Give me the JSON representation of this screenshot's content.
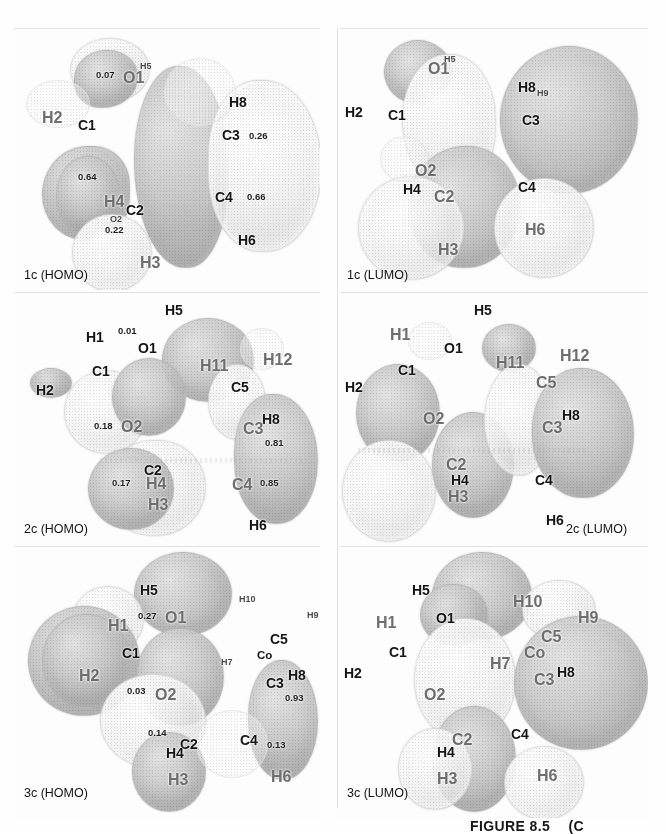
{
  "figure": {
    "caption": "FIGURE 8.5",
    "caption_suffix": "(C",
    "width": 666,
    "height": 832,
    "colors": {
      "background": "#fefefe",
      "lobe_light": "#f1f1f1",
      "lobe_dark": "#c9c9c9",
      "atom": "#a0a0a0",
      "text": "#151515",
      "rule": "#e2e2e2"
    }
  },
  "panels": [
    {
      "id": "1c-homo",
      "tag": "1c (HOMO)",
      "row": 0,
      "col": 0,
      "atoms": [
        {
          "label": "C1",
          "size": "big",
          "x": 78,
          "y": 118
        },
        {
          "label": "H2",
          "size": "faint",
          "x": 42,
          "y": 110
        },
        {
          "label": "O1",
          "size": "faint",
          "x": 123,
          "y": 70
        },
        {
          "label": "H5",
          "size": "sm",
          "x": 140,
          "y": 62
        },
        {
          "label": "C2",
          "size": "big",
          "x": 126,
          "y": 203
        },
        {
          "label": "H4",
          "size": "faint",
          "x": 104,
          "y": 194
        },
        {
          "label": "H3",
          "size": "faint",
          "x": 140,
          "y": 255
        },
        {
          "label": "O2",
          "size": "sm",
          "x": 110,
          "y": 215
        },
        {
          "label": "C3",
          "size": "big",
          "x": 222,
          "y": 128
        },
        {
          "label": "H8",
          "size": "big",
          "x": 229,
          "y": 95
        },
        {
          "label": "C4",
          "size": "big",
          "x": 215,
          "y": 190
        },
        {
          "label": "H6",
          "size": "big",
          "x": 238,
          "y": 233
        }
      ],
      "values": [
        {
          "text": "0.07",
          "x": 96,
          "y": 70
        },
        {
          "text": "0.64",
          "x": 78,
          "y": 172
        },
        {
          "text": "0.22",
          "x": 105,
          "y": 225
        },
        {
          "text": "0.26",
          "x": 249,
          "y": 131
        },
        {
          "text": "0.66",
          "x": 247,
          "y": 192
        }
      ]
    },
    {
      "id": "1c-lumo",
      "tag": "1c (LUMO)",
      "row": 0,
      "col": 1,
      "atoms": [
        {
          "label": "C1",
          "size": "big",
          "x": 388,
          "y": 108
        },
        {
          "label": "H2",
          "size": "big",
          "x": 345,
          "y": 105
        },
        {
          "label": "O1",
          "size": "faint",
          "x": 428,
          "y": 61
        },
        {
          "label": "H5",
          "size": "sm",
          "x": 444,
          "y": 55
        },
        {
          "label": "O2",
          "size": "faint",
          "x": 415,
          "y": 163
        },
        {
          "label": "C2",
          "size": "faint",
          "x": 434,
          "y": 189
        },
        {
          "label": "H4",
          "size": "big",
          "x": 403,
          "y": 182
        },
        {
          "label": "H3",
          "size": "faint",
          "x": 438,
          "y": 242
        },
        {
          "label": "C3",
          "size": "big",
          "x": 522,
          "y": 113
        },
        {
          "label": "H8",
          "size": "big",
          "x": 518,
          "y": 80
        },
        {
          "label": "H9",
          "size": "sm",
          "x": 537,
          "y": 89
        },
        {
          "label": "C4",
          "size": "big",
          "x": 518,
          "y": 180
        },
        {
          "label": "H6",
          "size": "faint",
          "x": 525,
          "y": 222
        }
      ],
      "values": []
    },
    {
      "id": "2c-homo",
      "tag": "2c (HOMO)",
      "row": 1,
      "col": 0,
      "atoms": [
        {
          "label": "H5",
          "size": "big",
          "x": 165,
          "y": 303
        },
        {
          "label": "H1",
          "size": "big",
          "x": 86,
          "y": 330
        },
        {
          "label": "O1",
          "size": "big",
          "x": 138,
          "y": 341
        },
        {
          "label": "C1",
          "size": "big",
          "x": 92,
          "y": 364
        },
        {
          "label": "H2",
          "size": "big",
          "x": 36,
          "y": 383
        },
        {
          "label": "O2",
          "size": "faint",
          "x": 121,
          "y": 419
        },
        {
          "label": "C5",
          "size": "big",
          "x": 231,
          "y": 380
        },
        {
          "label": "H11",
          "size": "faint",
          "x": 200,
          "y": 358
        },
        {
          "label": "H12",
          "size": "faint",
          "x": 263,
          "y": 352
        },
        {
          "label": "H8",
          "size": "big",
          "x": 262,
          "y": 412
        },
        {
          "label": "C3",
          "size": "faint",
          "x": 243,
          "y": 421
        },
        {
          "label": "C2",
          "size": "big",
          "x": 144,
          "y": 463
        },
        {
          "label": "H4",
          "size": "faint",
          "x": 146,
          "y": 476
        },
        {
          "label": "H3",
          "size": "faint",
          "x": 148,
          "y": 497
        },
        {
          "label": "C4",
          "size": "faint",
          "x": 232,
          "y": 477
        },
        {
          "label": "H6",
          "size": "big",
          "x": 249,
          "y": 518
        }
      ],
      "values": [
        {
          "text": "0.01",
          "x": 118,
          "y": 326
        },
        {
          "text": "0.18",
          "x": 94,
          "y": 421
        },
        {
          "text": "0.17",
          "x": 112,
          "y": 478
        },
        {
          "text": "0.81",
          "x": 265,
          "y": 438
        },
        {
          "text": "0.85",
          "x": 260,
          "y": 478
        }
      ]
    },
    {
      "id": "2c-lumo",
      "tag": "2c (LUMO)",
      "row": 1,
      "col": 1,
      "atoms": [
        {
          "label": "H5",
          "size": "big",
          "x": 474,
          "y": 303
        },
        {
          "label": "H1",
          "size": "faint",
          "x": 390,
          "y": 327
        },
        {
          "label": "O1",
          "size": "big",
          "x": 444,
          "y": 341
        },
        {
          "label": "C1",
          "size": "big",
          "x": 398,
          "y": 363
        },
        {
          "label": "H2",
          "size": "big",
          "x": 345,
          "y": 380
        },
        {
          "label": "O2",
          "size": "faint",
          "x": 423,
          "y": 411
        },
        {
          "label": "H11",
          "size": "faint",
          "x": 496,
          "y": 355
        },
        {
          "label": "H12",
          "size": "faint",
          "x": 560,
          "y": 348
        },
        {
          "label": "C5",
          "size": "faint",
          "x": 536,
          "y": 375
        },
        {
          "label": "H8",
          "size": "big",
          "x": 562,
          "y": 408
        },
        {
          "label": "C3",
          "size": "faint",
          "x": 542,
          "y": 420
        },
        {
          "label": "C2",
          "size": "faint",
          "x": 446,
          "y": 457
        },
        {
          "label": "H4",
          "size": "big",
          "x": 451,
          "y": 473
        },
        {
          "label": "H3",
          "size": "faint",
          "x": 448,
          "y": 489
        },
        {
          "label": "C4",
          "size": "big",
          "x": 535,
          "y": 473
        },
        {
          "label": "H6",
          "size": "big",
          "x": 546,
          "y": 513
        }
      ],
      "values": []
    },
    {
      "id": "3c-homo",
      "tag": "3c (HOMO)",
      "row": 2,
      "col": 0,
      "atoms": [
        {
          "label": "H5",
          "size": "big",
          "x": 140,
          "y": 583
        },
        {
          "label": "H1",
          "size": "faint",
          "x": 108,
          "y": 618
        },
        {
          "label": "O1",
          "size": "faint",
          "x": 165,
          "y": 610
        },
        {
          "label": "C1",
          "size": "big",
          "x": 122,
          "y": 646
        },
        {
          "label": "H2",
          "size": "faint",
          "x": 79,
          "y": 668
        },
        {
          "label": "O2",
          "size": "faint",
          "x": 155,
          "y": 687
        },
        {
          "label": "H10",
          "size": "sm",
          "x": 239,
          "y": 595
        },
        {
          "label": "H9",
          "size": "sm",
          "x": 307,
          "y": 611
        },
        {
          "label": "C5",
          "size": "big",
          "x": 270,
          "y": 632
        },
        {
          "label": "Co",
          "size": "mid",
          "x": 257,
          "y": 650
        },
        {
          "label": "H7",
          "size": "sm",
          "x": 221,
          "y": 658
        },
        {
          "label": "C3",
          "size": "big",
          "x": 266,
          "y": 676
        },
        {
          "label": "H8",
          "size": "big",
          "x": 288,
          "y": 668
        },
        {
          "label": "C2",
          "size": "big",
          "x": 180,
          "y": 737
        },
        {
          "label": "H4",
          "size": "big",
          "x": 166,
          "y": 746
        },
        {
          "label": "H3",
          "size": "faint",
          "x": 168,
          "y": 772
        },
        {
          "label": "C4",
          "size": "big",
          "x": 240,
          "y": 733
        },
        {
          "label": "H6",
          "size": "faint",
          "x": 271,
          "y": 769
        }
      ],
      "values": [
        {
          "text": "0.27",
          "x": 138,
          "y": 611
        },
        {
          "text": "0.03",
          "x": 127,
          "y": 686
        },
        {
          "text": "0.14",
          "x": 148,
          "y": 728
        },
        {
          "text": "0.93",
          "x": 285,
          "y": 693
        },
        {
          "text": "0.13",
          "x": 267,
          "y": 740
        }
      ]
    },
    {
      "id": "3c-lumo",
      "tag": "3c (LUMO)",
      "row": 2,
      "col": 1,
      "atoms": [
        {
          "label": "H5",
          "size": "big",
          "x": 412,
          "y": 583
        },
        {
          "label": "H1",
          "size": "faint",
          "x": 376,
          "y": 615
        },
        {
          "label": "O1",
          "size": "big",
          "x": 436,
          "y": 611
        },
        {
          "label": "C1",
          "size": "big",
          "x": 389,
          "y": 645
        },
        {
          "label": "H2",
          "size": "big",
          "x": 344,
          "y": 666
        },
        {
          "label": "O2",
          "size": "faint",
          "x": 424,
          "y": 687
        },
        {
          "label": "H10",
          "size": "faint",
          "x": 513,
          "y": 594
        },
        {
          "label": "H9",
          "size": "faint",
          "x": 578,
          "y": 610
        },
        {
          "label": "C5",
          "size": "faint",
          "x": 541,
          "y": 629
        },
        {
          "label": "Co",
          "size": "faint",
          "x": 524,
          "y": 645
        },
        {
          "label": "H7",
          "size": "faint",
          "x": 490,
          "y": 656
        },
        {
          "label": "C3",
          "size": "faint",
          "x": 534,
          "y": 672
        },
        {
          "label": "H8",
          "size": "big",
          "x": 557,
          "y": 665
        },
        {
          "label": "C2",
          "size": "faint",
          "x": 452,
          "y": 732
        },
        {
          "label": "H4",
          "size": "big",
          "x": 437,
          "y": 745
        },
        {
          "label": "H3",
          "size": "faint",
          "x": 437,
          "y": 771
        },
        {
          "label": "C4",
          "size": "big",
          "x": 511,
          "y": 727
        },
        {
          "label": "H6",
          "size": "faint",
          "x": 537,
          "y": 768
        }
      ],
      "values": []
    }
  ]
}
